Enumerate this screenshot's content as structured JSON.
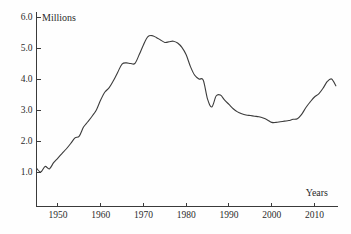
{
  "chart_data": {
    "type": "line",
    "title": "",
    "xlabel": "Years",
    "ylabel": "Millions",
    "grid": false,
    "legend": "none",
    "xlim": [
      1945,
      2015.5
    ],
    "ylim": [
      0,
      6.0
    ],
    "y_ticks": [
      "1.0",
      "2.0",
      "3.0",
      "4.0",
      "5.0",
      "6.0"
    ],
    "y_tick_values": [
      1.0,
      2.0,
      3.0,
      4.0,
      5.0,
      6.0
    ],
    "x_ticks": [
      "1950",
      "1960",
      "1970",
      "1980",
      "1990",
      "2000",
      "2010"
    ],
    "x_tick_values": [
      1950,
      1960,
      1970,
      1980,
      1990,
      2000,
      2010
    ],
    "series": [
      {
        "name": "Millions",
        "color": "#3c3c3c",
        "x": [
          1945,
          1946,
          1947,
          1948,
          1949,
          1950,
          1951,
          1952,
          1953,
          1954,
          1955,
          1956,
          1957,
          1958,
          1959,
          1960,
          1961,
          1962,
          1963,
          1964,
          1965,
          1966,
          1967,
          1968,
          1969,
          1970,
          1971,
          1972,
          1973,
          1974,
          1975,
          1976,
          1977,
          1978,
          1979,
          1980,
          1981,
          1982,
          1983,
          1984,
          1985,
          1986,
          1987,
          1988,
          1989,
          1990,
          1991,
          1992,
          1993,
          1994,
          1995,
          1996,
          1997,
          1998,
          1999,
          2000,
          2001,
          2002,
          2003,
          2004,
          2005,
          2006,
          2007,
          2008,
          2009,
          2010,
          2011,
          2012,
          2013,
          2014,
          2015
        ],
        "values": [
          1.12,
          1.0,
          1.18,
          1.1,
          1.3,
          1.45,
          1.6,
          1.75,
          1.92,
          2.1,
          2.16,
          2.45,
          2.62,
          2.8,
          3.0,
          3.32,
          3.58,
          3.72,
          3.95,
          4.22,
          4.48,
          4.52,
          4.5,
          4.5,
          4.78,
          5.1,
          5.36,
          5.4,
          5.34,
          5.26,
          5.18,
          5.2,
          5.22,
          5.16,
          5.02,
          4.78,
          4.4,
          4.12,
          4.0,
          3.96,
          3.35,
          3.1,
          3.45,
          3.48,
          3.32,
          3.18,
          3.04,
          2.94,
          2.88,
          2.84,
          2.82,
          2.8,
          2.78,
          2.74,
          2.68,
          2.6,
          2.6,
          2.62,
          2.64,
          2.66,
          2.7,
          2.72,
          2.86,
          3.08,
          3.26,
          3.42,
          3.52,
          3.7,
          3.92,
          4.0,
          3.78
        ]
      }
    ]
  },
  "labels": {
    "y_axis_title": "Millions",
    "x_axis_title": "Years"
  }
}
